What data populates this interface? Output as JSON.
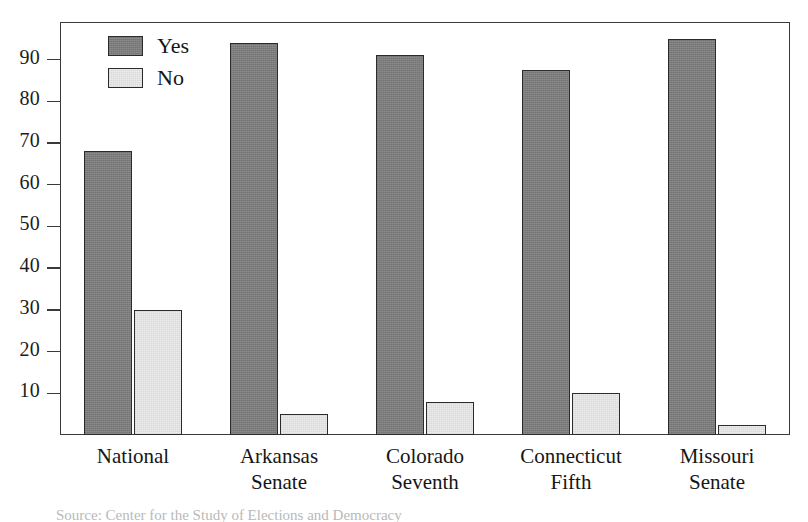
{
  "chart_data": {
    "type": "bar",
    "title": "",
    "subtitle": "",
    "xlabel": "",
    "ylabel": "",
    "categories": [
      "National",
      "Arkansas Senate",
      "Colorado Seventh",
      "Connecticut Fifth",
      "Missouri Senate"
    ],
    "category_lines": [
      [
        "National",
        ""
      ],
      [
        "Arkansas",
        "Senate"
      ],
      [
        "Colorado",
        "Seventh"
      ],
      [
        "Connecticut",
        "Fifth"
      ],
      [
        "Missouri",
        "Senate"
      ]
    ],
    "series": [
      {
        "name": "Yes",
        "color": "#7d7d7d",
        "values": [
          68,
          94,
          91,
          87.5,
          95
        ]
      },
      {
        "name": "No",
        "color": "#ececec",
        "values": [
          30,
          5,
          8,
          10,
          2.5
        ]
      }
    ],
    "ylim": [
      0,
      99
    ],
    "yticks": [
      10,
      20,
      30,
      40,
      50,
      60,
      70,
      80,
      90
    ],
    "ytick_labels": [
      "10",
      "20",
      "30",
      "40",
      "50",
      "60",
      "70",
      "80",
      "90"
    ],
    "grid": false,
    "legend": {
      "position": "top-left",
      "entries": [
        {
          "label": "Yes",
          "swatch": "dark-gray-filled"
        },
        {
          "label": "No",
          "swatch": "light-gray-filled"
        }
      ]
    },
    "frame": true
  },
  "caption": {
    "text": "Source: Center for the Study of Elections and Democracy"
  }
}
